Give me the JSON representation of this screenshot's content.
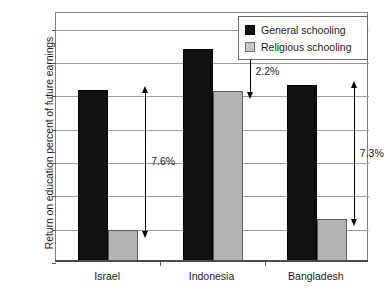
{
  "chart_data": {
    "type": "bar",
    "title": "",
    "xlabel": "",
    "ylabel": "Return on education percent of future earnings",
    "ylim": [
      0,
      15
    ],
    "yticks": [
      0,
      2,
      4,
      6,
      8,
      10,
      12,
      14
    ],
    "ytick_labels": [
      "0",
      "2",
      "4",
      "6",
      "8",
      "10",
      "12",
      "14"
    ],
    "grid": true,
    "legend_position": "top-right",
    "categories": [
      "Israel",
      "Indonesia",
      "Bangladesh"
    ],
    "series": [
      {
        "name": "General schooling",
        "color": "#111111",
        "values": [
          10.25,
          12.7,
          10.55
        ]
      },
      {
        "name": "Religious schooling",
        "color": "#b3b3b3",
        "values": [
          1.85,
          10.2,
          2.55
        ]
      }
    ],
    "annotations": [
      {
        "category": "Israel",
        "label": "7.6%",
        "from": 10.25,
        "to": 1.85
      },
      {
        "category": "Indonesia",
        "label": "2.2%",
        "from": 12.7,
        "to": 10.2
      },
      {
        "category": "Bangladesh",
        "label": "7.3%",
        "from": 10.55,
        "to": 2.55
      }
    ]
  },
  "legend": {
    "items": [
      {
        "label": "General schooling"
      },
      {
        "label": "Religious schooling"
      }
    ]
  },
  "axis": {
    "y_title": "Return on education percent of future earnings",
    "y_labels": [
      "14",
      "12",
      "10",
      "8",
      "6",
      "4",
      "2",
      "0"
    ],
    "x_labels": [
      "Israel",
      "Indonesia",
      "Bangladesh"
    ]
  },
  "annotation_labels": [
    "7.6%",
    "2.2%",
    "7.3%"
  ]
}
